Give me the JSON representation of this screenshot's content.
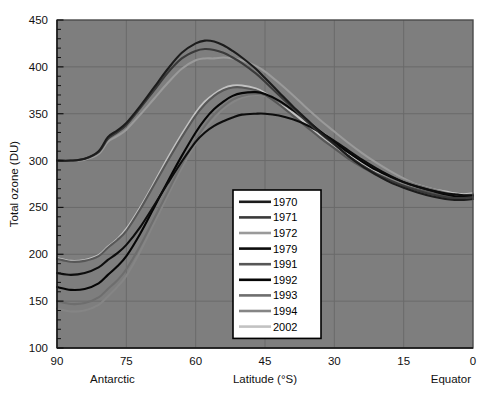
{
  "chart_data": {
    "type": "line",
    "title": "",
    "xlabel": "Latitude (°S)",
    "ylabel": "Total ozone (DU)",
    "xlim": [
      90,
      0
    ],
    "ylim": [
      100,
      450
    ],
    "x_ticks": [
      90,
      75,
      60,
      45,
      30,
      15,
      0
    ],
    "y_ticks": [
      100,
      150,
      200,
      250,
      300,
      350,
      400,
      450
    ],
    "x_minor_step": 5,
    "y_minor_step": 10,
    "grid": true,
    "x_axis_reversed": true,
    "left_annotation": "Antarctic",
    "right_annotation": "Equator",
    "legend_position": "center-bottom-inside",
    "plot_background": "#7e7e7e",
    "x": [
      90,
      87,
      84,
      81,
      79,
      77,
      75,
      72,
      69,
      66,
      63,
      60,
      58,
      56,
      54,
      52,
      50,
      47,
      45,
      42,
      39,
      36,
      33,
      30,
      27,
      24,
      21,
      18,
      15,
      12,
      9,
      6,
      4,
      2,
      0
    ],
    "series": [
      {
        "name": "1970",
        "color": "#1c1c1c",
        "values": [
          300,
          300,
          302,
          310,
          325,
          332,
          340,
          358,
          378,
          398,
          415,
          425,
          428,
          427,
          423,
          417,
          410,
          398,
          388,
          373,
          358,
          344,
          330,
          318,
          305,
          294,
          285,
          277,
          271,
          266,
          262,
          259,
          258,
          258,
          259
        ]
      },
      {
        "name": "1971",
        "color": "#3a3a3a",
        "values": [
          300,
          300,
          302,
          309,
          323,
          330,
          338,
          356,
          375,
          394,
          409,
          417,
          419,
          418,
          415,
          410,
          404,
          393,
          384,
          370,
          356,
          342,
          329,
          317,
          305,
          295,
          286,
          279,
          273,
          268,
          264,
          261,
          260,
          260,
          261
        ]
      },
      {
        "name": "1972",
        "color": "#9a9a9a",
        "values": [
          300,
          300,
          301,
          307,
          320,
          326,
          333,
          349,
          366,
          383,
          398,
          407,
          409,
          409,
          410,
          409,
          407,
          401,
          395,
          383,
          370,
          356,
          343,
          331,
          319,
          308,
          298,
          289,
          281,
          274,
          269,
          264,
          262,
          262,
          263
        ]
      },
      {
        "name": "1979",
        "color": "#0d0d0d",
        "values": [
          180,
          178,
          180,
          186,
          194,
          201,
          210,
          229,
          252,
          276,
          299,
          320,
          330,
          337,
          342,
          346,
          349,
          350,
          350,
          348,
          344,
          338,
          330,
          321,
          311,
          301,
          292,
          284,
          277,
          272,
          268,
          265,
          264,
          263,
          263
        ]
      },
      {
        "name": "1991",
        "color": "#575757",
        "values": [
          195,
          192,
          193,
          198,
          207,
          215,
          225,
          248,
          274,
          300,
          325,
          348,
          360,
          369,
          375,
          378,
          378,
          375,
          370,
          360,
          348,
          336,
          324,
          313,
          302,
          293,
          285,
          278,
          273,
          269,
          266,
          263,
          262,
          261,
          262
        ]
      },
      {
        "name": "1992",
        "color": "#060606",
        "values": [
          165,
          162,
          163,
          169,
          178,
          187,
          198,
          222,
          250,
          278,
          305,
          330,
          344,
          355,
          363,
          369,
          372,
          373,
          371,
          364,
          354,
          343,
          331,
          320,
          309,
          299,
          290,
          283,
          277,
          272,
          268,
          264,
          262,
          261,
          262
        ]
      },
      {
        "name": "1993",
        "color": "#6e6e6e",
        "values": [
          150,
          147,
          148,
          154,
          163,
          172,
          184,
          209,
          238,
          267,
          296,
          322,
          337,
          349,
          358,
          365,
          369,
          371,
          370,
          363,
          354,
          343,
          331,
          320,
          310,
          300,
          291,
          284,
          278,
          273,
          269,
          265,
          263,
          262,
          263
        ]
      },
      {
        "name": "1994",
        "color": "#858585",
        "values": [
          142,
          139,
          140,
          146,
          155,
          165,
          177,
          203,
          233,
          263,
          292,
          318,
          333,
          345,
          355,
          362,
          367,
          370,
          369,
          363,
          354,
          343,
          332,
          321,
          311,
          301,
          292,
          285,
          279,
          274,
          270,
          266,
          264,
          263,
          264
        ]
      },
      {
        "name": "2002",
        "color": "#c2c2c2",
        "values": [
          196,
          193,
          194,
          199,
          208,
          216,
          227,
          250,
          276,
          303,
          328,
          351,
          363,
          371,
          377,
          380,
          380,
          377,
          372,
          362,
          351,
          339,
          327,
          316,
          306,
          297,
          289,
          283,
          278,
          274,
          270,
          267,
          265,
          264,
          265
        ]
      }
    ]
  },
  "legend": {
    "entries": [
      {
        "label": "1970"
      },
      {
        "label": "1971"
      },
      {
        "label": "1972"
      },
      {
        "label": "1979"
      },
      {
        "label": "1991"
      },
      {
        "label": "1992"
      },
      {
        "label": "1993"
      },
      {
        "label": "1994"
      },
      {
        "label": "2002"
      }
    ]
  }
}
